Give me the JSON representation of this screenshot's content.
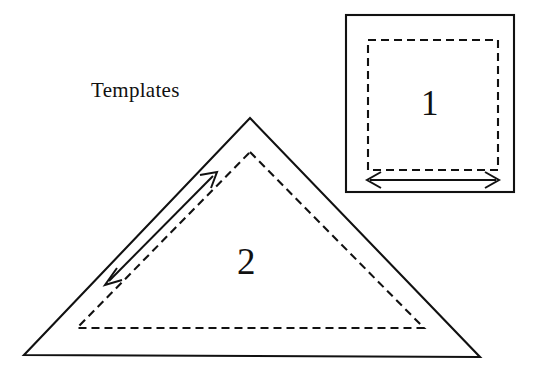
{
  "figure": {
    "caption_label": "Templates",
    "background_color": "#ffffff",
    "line_color": "#111111",
    "shapes": [
      {
        "id": "template-1",
        "number_label": "1",
        "outline_shape": "square",
        "outline_style": "solid",
        "inner_style": "dashed",
        "has_dimension_arrow": true,
        "arrow_type": "double-headed-horizontal"
      },
      {
        "id": "template-2",
        "number_label": "2",
        "outline_shape": "triangle",
        "outline_style": "solid",
        "inner_style": "dashed",
        "has_dimension_arrow": true,
        "arrow_type": "double-headed-diagonal"
      }
    ]
  },
  "geometry": {
    "outer_square": {
      "x1": 346,
      "y1": 15,
      "x2": 514,
      "y2": 192
    },
    "dashed_square": {
      "x1": 368,
      "y1": 40,
      "x2": 498,
      "y2": 170
    },
    "square_arrow": {
      "x1": 368,
      "y1": 180,
      "x2": 498,
      "y2": 180
    },
    "outer_triangle": {
      "apex_x": 250,
      "apex_y": 118,
      "left_x": 24,
      "left_y": 355,
      "right_x": 480,
      "right_y": 357
    },
    "dashed_triangle": {
      "apex_x": 250,
      "apex_y": 152,
      "left_x": 77,
      "left_y": 328,
      "right_x": 424,
      "right_y": 328
    },
    "triangle_arrow": {
      "x1": 105,
      "y1": 285,
      "x2": 217,
      "y2": 172
    }
  }
}
